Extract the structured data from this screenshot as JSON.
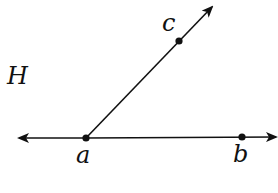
{
  "diagram": {
    "type": "geometry-angle",
    "plane_label": "H",
    "line": {
      "through_points": [
        "a",
        "b"
      ],
      "description": "line ab with arrows at both ends"
    },
    "ray": {
      "from": "a",
      "through": "c",
      "description": "ray ac with arrow beyond c"
    },
    "points": [
      {
        "name": "a",
        "label": "a",
        "x": 86,
        "y": 138
      },
      {
        "name": "b",
        "label": "b",
        "x": 242,
        "y": 137
      },
      {
        "name": "c",
        "label": "c",
        "x": 179,
        "y": 41
      }
    ],
    "colors": {
      "stroke": "#111111",
      "background": "#ffffff"
    }
  }
}
